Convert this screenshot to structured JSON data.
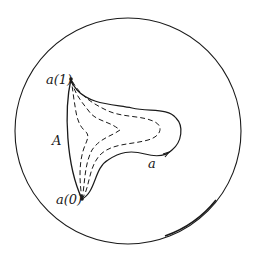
{
  "diagram": {
    "type": "homotopy-of-path-in-disk",
    "boundary": {
      "shape": "circle",
      "cx": 128,
      "cy": 131,
      "r": 113
    },
    "points": {
      "a1": {
        "label": "a(1)",
        "x": 71,
        "y": 79
      },
      "a0": {
        "label": "a(0)",
        "x": 82,
        "y": 199
      }
    },
    "labels": {
      "arc_A": "A",
      "path_a": "a",
      "a1": "a(1)",
      "a0": "a(0)"
    },
    "curves": {
      "arc_A": "solid arc from a(1) to a(0)",
      "path_a": "solid loop from a(0) to a(1) with arrow",
      "intermediate": [
        "dashed",
        "dashed",
        "dashed"
      ]
    },
    "colors": {
      "stroke": "#1a1a1a",
      "background": "#ffffff"
    }
  }
}
